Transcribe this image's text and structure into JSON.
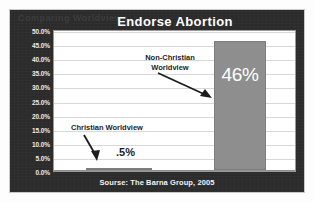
{
  "chart_data": {
    "type": "bar",
    "title": "Endorse Abortion",
    "categories": [
      "Christian Worldview",
      "Non-Christian Worldview"
    ],
    "values": [
      0.5,
      46
    ],
    "value_labels": [
      ".5%",
      "46%"
    ],
    "xlabel": "",
    "ylabel": "",
    "ylim": [
      0,
      50
    ],
    "ytick_step": 5,
    "yticks": [
      "50.0%",
      "45.0%",
      "40.0%",
      "35.0%",
      "30.0%",
      "25.0%",
      "20.0%",
      "15.0%",
      "10.0%",
      "5.0%",
      "0.0%"
    ],
    "grid": true,
    "legend": "none",
    "annotations": [
      {
        "text": "Non-Christian Worldview",
        "line1": "Non-Christian",
        "line2": "Worldview",
        "points_to": "Non-Christian Worldview bar"
      },
      {
        "text": "Christian Worldview",
        "line1": "Christian Worldview",
        "line2": "",
        "points_to": "Christian Worldview bar"
      }
    ],
    "source": "Sourse: The Barna Group, 2005",
    "colors": {
      "panel_background": "#2b2b2b",
      "plot_background": "#ffffff",
      "bar_fill": "#8e8e8e",
      "gridline": "#d8d8d8",
      "title_text": "#ffffff",
      "axis_text": "#ededed",
      "annotation_text": "#1c1c1c"
    }
  },
  "watermark": {
    "text": "Comparing Worldviews"
  }
}
